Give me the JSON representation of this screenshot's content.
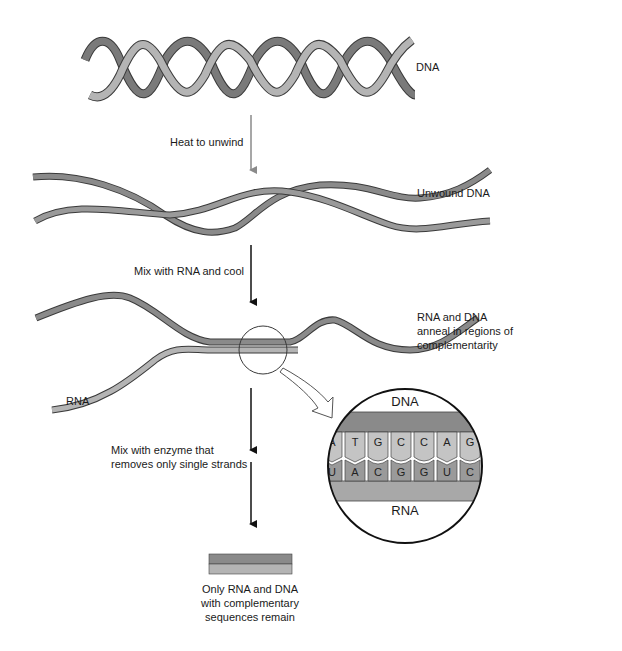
{
  "colors": {
    "dark_strand": "#7a7a7a",
    "light_strand": "#b4b4b4",
    "outline": "#3a3a3a",
    "arrow_gray": "#8a8a8a",
    "arrow_black": "#111111",
    "background": "#ffffff"
  },
  "stages": {
    "dna": {
      "label": "DNA"
    },
    "step1": {
      "label": "Heat to unwind"
    },
    "unwound": {
      "label": "Unwound DNA"
    },
    "step2": {
      "label": "Mix with RNA and cool"
    },
    "anneal": {
      "label": "RNA and DNA\nanneal in regions of\ncomplementarity"
    },
    "rna_strand": {
      "label": "RNA"
    },
    "step3": {
      "label": "Mix with enzyme that\nremoves only single strands"
    },
    "result": {
      "label": "Only RNA and DNA\nwith complementary\nsequences remain"
    }
  },
  "inset": {
    "top_label": "DNA",
    "bottom_label": "RNA",
    "dna_bases": [
      "A",
      "T",
      "G",
      "C",
      "C",
      "A",
      "G"
    ],
    "rna_bases": [
      "U",
      "A",
      "C",
      "G",
      "G",
      "U",
      "C"
    ]
  }
}
